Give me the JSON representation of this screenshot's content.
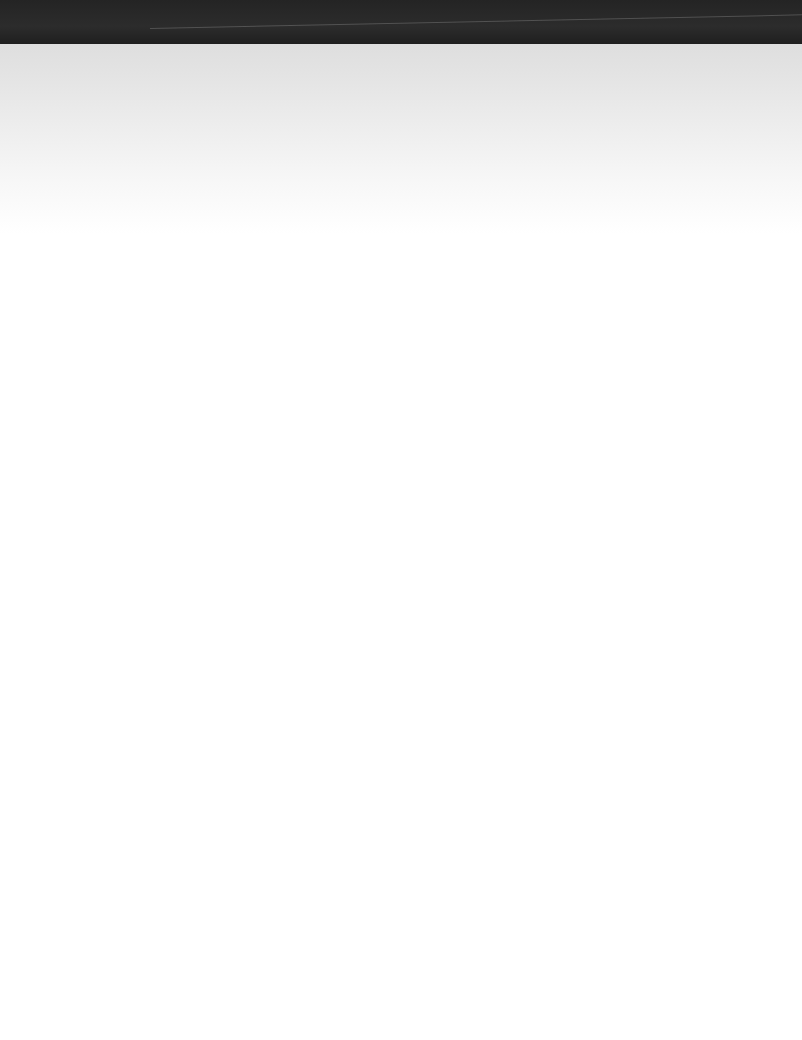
{
  "document": {
    "type": "scanned-blank-page",
    "footer_text": ""
  }
}
